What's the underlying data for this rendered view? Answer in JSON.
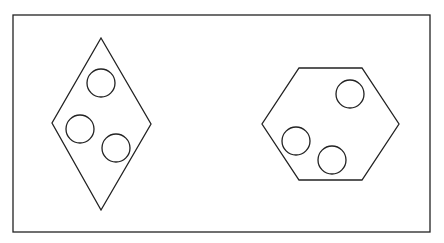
{
  "diagram": {
    "width": 444,
    "height": 243,
    "background": "#ffffff",
    "stroke_color": "#222222",
    "frame": {
      "x": 13,
      "y": 15,
      "width": 417,
      "height": 217,
      "stroke_width": 1.3
    },
    "shapes": [
      {
        "id": "diamond",
        "type": "rhombus",
        "points": [
          [
            101,
            38
          ],
          [
            151,
            124
          ],
          [
            101,
            210
          ],
          [
            52,
            123
          ]
        ],
        "stroke_width": 1.3,
        "circles": [
          {
            "cx": 101,
            "cy": 83,
            "r": 14
          },
          {
            "cx": 80,
            "cy": 129,
            "r": 14
          },
          {
            "cx": 116,
            "cy": 148,
            "r": 14
          }
        ]
      },
      {
        "id": "hexagon",
        "type": "hexagon",
        "points": [
          [
            299,
            68
          ],
          [
            362,
            68
          ],
          [
            399,
            124
          ],
          [
            362,
            180
          ],
          [
            299,
            180
          ],
          [
            262,
            124
          ]
        ],
        "stroke_width": 1.3,
        "circles": [
          {
            "cx": 350,
            "cy": 94,
            "r": 14
          },
          {
            "cx": 296,
            "cy": 141,
            "r": 14
          },
          {
            "cx": 332,
            "cy": 160,
            "r": 14
          }
        ]
      }
    ]
  }
}
